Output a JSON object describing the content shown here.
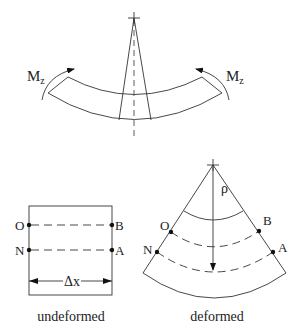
{
  "top_figure": {
    "moment_left": {
      "symbol": "M",
      "subscript": "z"
    },
    "moment_right": {
      "symbol": "M",
      "subscript": "z"
    }
  },
  "undeformed": {
    "caption": "undeformed",
    "points": {
      "O": "O",
      "B": "B",
      "N": "N",
      "A": "A"
    },
    "dimension_label": "Δx"
  },
  "deformed": {
    "caption": "deformed",
    "points": {
      "O": "O",
      "B": "B",
      "N": "N",
      "A": "A"
    },
    "radius_label": "ρ"
  }
}
